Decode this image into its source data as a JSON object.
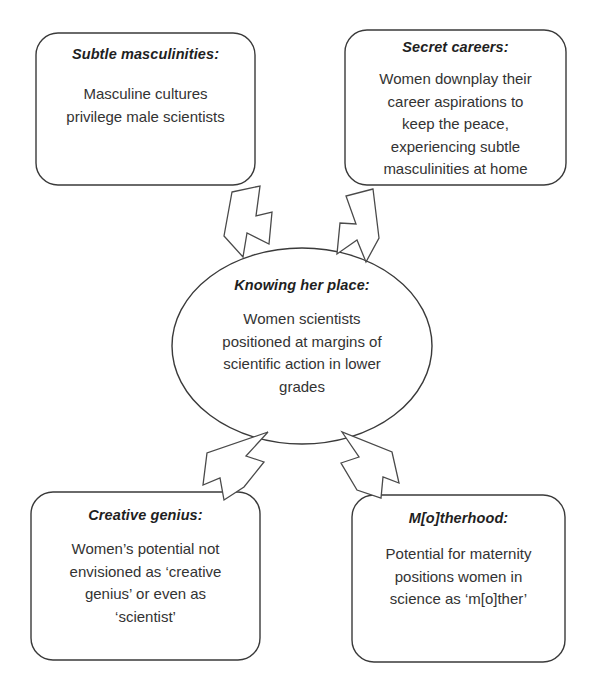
{
  "diagram": {
    "background_color": "#ffffff",
    "stroke_color": "#3a3a3a",
    "text_color": "#333333",
    "nodes": {
      "subtle_masculinities": {
        "title": "Subtle masculinities:",
        "body_line1": "Masculine cultures",
        "body_line2": "privilege male scientists"
      },
      "secret_careers": {
        "title": "Secret careers:",
        "body_line1": "Women downplay their",
        "body_line2": "career aspirations to",
        "body_line3": "keep the peace,",
        "body_line4": "experiencing subtle",
        "body_line5": "masculinities at home"
      },
      "knowing_her_place": {
        "title": "Knowing her place:",
        "body_line1": "Women scientists",
        "body_line2": "positioned at margins of",
        "body_line3": "scientific action in lower",
        "body_line4": "grades"
      },
      "creative_genius": {
        "title": "Creative genius:",
        "body_line1": "Women’s potential not",
        "body_line2": "envisioned as ‘creative",
        "body_line3": "genius’ or even as",
        "body_line4": "‘scientist’"
      },
      "motherhood": {
        "title": "M[o]therhood:",
        "body_line1": "Potential for maternity",
        "body_line2": "positions women in",
        "body_line3": "science as ‘m[o]ther’"
      }
    },
    "connectors": [
      {
        "name": "arrow-subtle-masculinities-to-center",
        "from": "subtle_masculinities",
        "to": "knowing_her_place",
        "direction": "down-right"
      },
      {
        "name": "arrow-secret-careers-to-center",
        "from": "secret_careers",
        "to": "knowing_her_place",
        "direction": "down-left"
      },
      {
        "name": "arrow-creative-genius-to-center",
        "from": "creative_genius",
        "to": "knowing_her_place",
        "direction": "up-right"
      },
      {
        "name": "arrow-motherhood-to-center",
        "from": "motherhood",
        "to": "knowing_her_place",
        "direction": "up-left"
      }
    ]
  }
}
